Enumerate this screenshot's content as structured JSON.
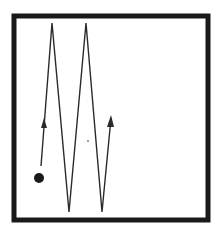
{
  "diagram": {
    "box": {
      "x": 14,
      "y": 16,
      "width": 194,
      "height": 204,
      "stroke": "#1a1a1a",
      "stroke_width": 5
    },
    "particle": {
      "cx": 39,
      "cy": 178,
      "r": 5,
      "fill": "#1a1a1a"
    },
    "path_points": "41,166 52,23 69,212 86,23 102,212 111,118",
    "arrows": [
      {
        "name": "first-segment-arrow",
        "points": "44,118 41,128 47,128"
      },
      {
        "name": "final-segment-arrow",
        "points": "111,115 107,127 114,127"
      }
    ],
    "stray_dot": {
      "cx": 88,
      "cy": 141,
      "r": 0.8
    },
    "line_color": "#2a2a2a"
  }
}
